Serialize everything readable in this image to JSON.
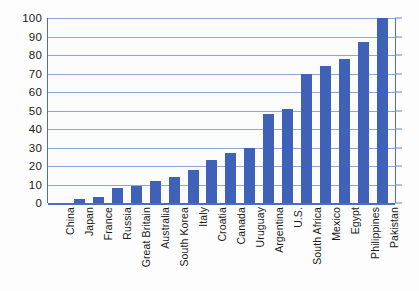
{
  "chart_data": {
    "type": "bar",
    "title": "",
    "xlabel": "",
    "ylabel": "",
    "ylim": [
      0,
      100
    ],
    "ytick_step": 10,
    "yticks": [
      100,
      90,
      80,
      70,
      60,
      50,
      40,
      30,
      20,
      10,
      0
    ],
    "grid": true,
    "legend": false,
    "bar_color": "#3f61b8",
    "gridline_color": "#8fa4d8",
    "axis_color": "#4a6ec0",
    "categories": [
      "China",
      "Japan",
      "France",
      "Russia",
      "Great Britain",
      "Australia",
      "South Korea",
      "Italy",
      "Croatia",
      "Canada",
      "Uruguay",
      "Argentina",
      "U.S.",
      "South Africa",
      "Mexico",
      "Egypt",
      "Philippines",
      "Pakistan"
    ],
    "values": [
      0,
      2,
      3,
      8,
      9,
      12,
      14,
      18,
      23,
      27,
      30,
      48,
      51,
      70,
      74,
      78,
      87,
      100
    ]
  }
}
